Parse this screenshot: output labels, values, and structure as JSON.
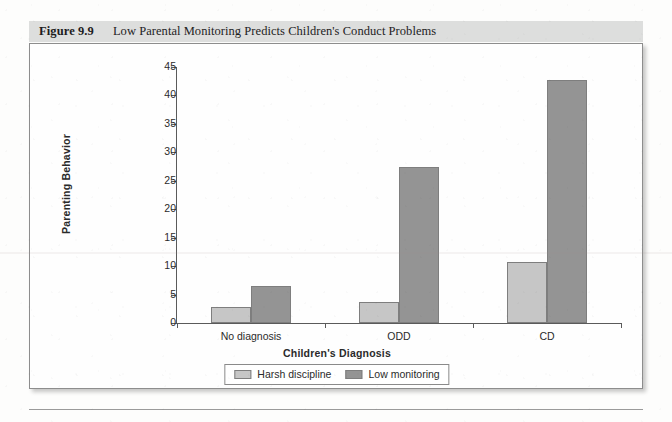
{
  "figure": {
    "number": "Figure 9.9",
    "title": "Low Parental Monitoring Predicts Children's Conduct Problems"
  },
  "colors": {
    "harsh_discipline": "#c6c6c6",
    "low_monitoring": "#949494",
    "header_band": "#dddedd",
    "axis": "#5a5a5a",
    "bar_outline": "#7e7e7e"
  },
  "chart_data": {
    "type": "bar",
    "title": "Low Parental Monitoring Predicts Children's Conduct Problems",
    "xlabel": "Children's Diagnosis",
    "ylabel": "Parenting Behavior",
    "categories": [
      "No diagnosis",
      "ODD",
      "CD"
    ],
    "series": [
      {
        "name": "Harsh discipline",
        "values": [
          2.8,
          3.7,
          10.8
        ]
      },
      {
        "name": "Low monitoring",
        "values": [
          6.5,
          27.5,
          42.7
        ]
      }
    ],
    "ylim": [
      0,
      45
    ],
    "yticks": [
      0,
      5,
      10,
      15,
      20,
      25,
      30,
      35,
      40,
      45
    ],
    "ytick_labels": [
      "0",
      "5",
      "10",
      "15",
      "20",
      "25",
      "30",
      "35",
      "40",
      "45"
    ],
    "grid": false,
    "legend_position": "bottom"
  }
}
